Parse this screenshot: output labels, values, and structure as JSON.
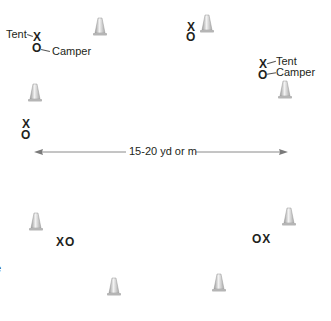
{
  "diagram": {
    "type": "drill-field-layout",
    "cone_color": "#c8c8c8",
    "line_color": "#8a8a8a",
    "text_color": "#231f20",
    "distance_label": "15-20 yd or m",
    "legend": {
      "tent_label": "Tent",
      "camper_label": "Camper",
      "tent_symbol": "X",
      "camper_symbol": "O"
    },
    "groups": [
      {
        "id": "top-left",
        "tent": "X",
        "camper": "O",
        "tent_label": "Tent",
        "camper_label": "Camper"
      },
      {
        "id": "top-center",
        "tent": "X",
        "camper": "O"
      },
      {
        "id": "right",
        "tent": "X",
        "camper": "O",
        "tent_label": "Tent",
        "camper_label": "Camper"
      },
      {
        "id": "left",
        "tent": "X",
        "camper": "O"
      },
      {
        "id": "lower-left",
        "text": "XO"
      },
      {
        "id": "lower-right",
        "text": "OX"
      }
    ],
    "cones": 8,
    "edge_fragment": "e"
  }
}
